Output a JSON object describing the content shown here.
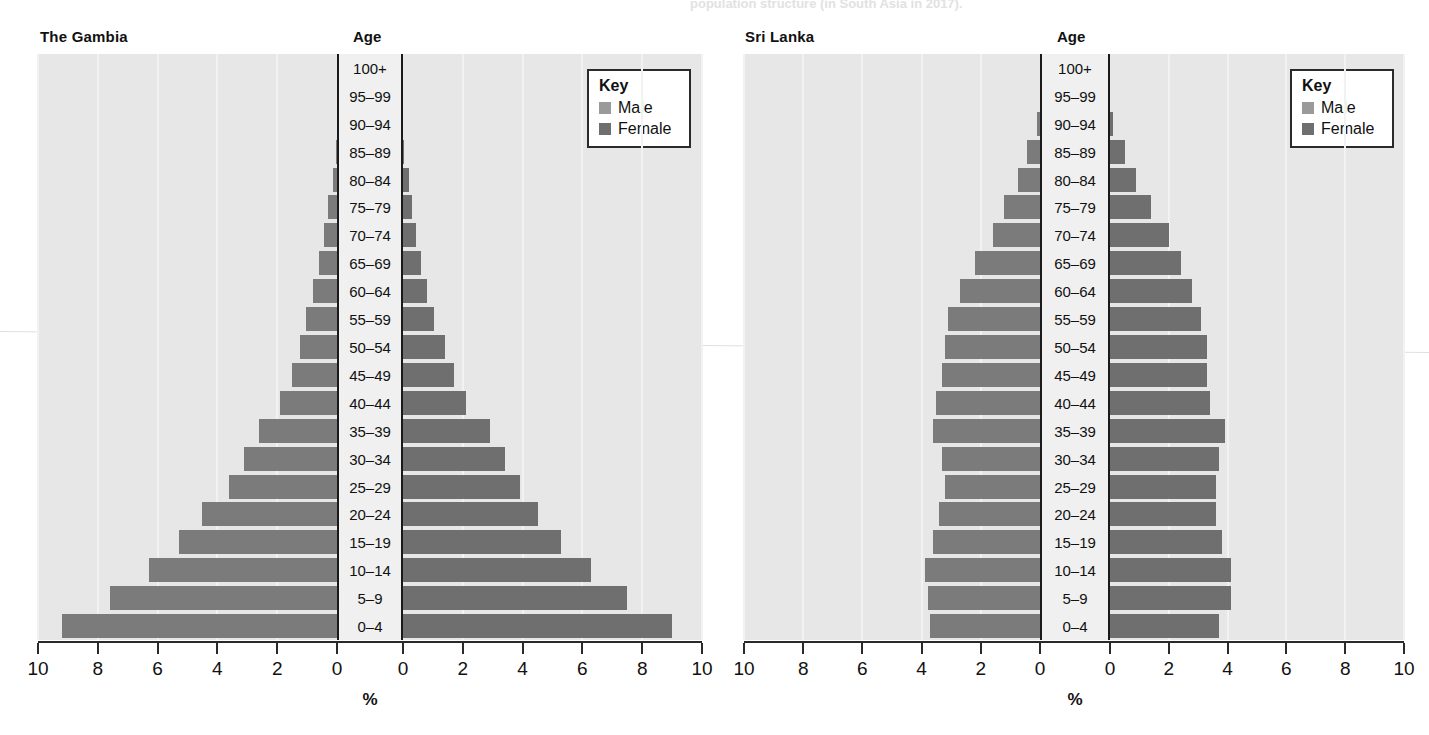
{
  "top_caption": "population structure (in South Asia in 2017).",
  "key": {
    "title": "Key",
    "male_label": "Male",
    "female_label": "Female",
    "male_color": "#9a9a9a",
    "female_color": "#6f6f6f"
  },
  "axis": {
    "title": "%",
    "age_header": "Age",
    "tick_labels_left": [
      "10",
      "8",
      "6",
      "4",
      "2",
      "0"
    ],
    "tick_labels_right": [
      "0",
      "2",
      "4",
      "6",
      "8",
      "10"
    ],
    "max": 10
  },
  "age_groups": [
    "100+",
    "95–99",
    "90–94",
    "85–89",
    "80–84",
    "75–79",
    "70–74",
    "65–69",
    "60–64",
    "55–59",
    "50–54",
    "45–49",
    "40–44",
    "35–39",
    "30–34",
    "25–29",
    "20–24",
    "15–19",
    "10–14",
    "5–9",
    "0–4"
  ],
  "chart_data": [
    {
      "type": "bar",
      "title": "The Gambia",
      "xlabel": "%",
      "ylabel": "Age",
      "xlim": [
        0,
        10
      ],
      "grid": true,
      "legend_position": "top-right",
      "categories": [
        "100+",
        "95–99",
        "90–94",
        "85–89",
        "80–84",
        "75–79",
        "70–74",
        "65–69",
        "60–64",
        "55–59",
        "50–54",
        "45–49",
        "40–44",
        "35–39",
        "30–34",
        "25–29",
        "20–24",
        "15–19",
        "10–14",
        "5–9",
        "0–4"
      ],
      "series": [
        {
          "name": "Male",
          "values": [
            0.0,
            0.0,
            0.0,
            0.05,
            0.15,
            0.3,
            0.45,
            0.6,
            0.8,
            1.05,
            1.25,
            1.5,
            1.9,
            2.6,
            3.1,
            3.6,
            4.5,
            5.3,
            6.3,
            7.6,
            9.2
          ]
        },
        {
          "name": "Female",
          "values": [
            0.0,
            0.0,
            0.0,
            0.05,
            0.2,
            0.3,
            0.45,
            0.6,
            0.8,
            1.05,
            1.4,
            1.7,
            2.1,
            2.9,
            3.4,
            3.9,
            4.5,
            5.3,
            6.3,
            7.5,
            9.0
          ]
        }
      ]
    },
    {
      "type": "bar",
      "title": "Sri Lanka",
      "xlabel": "%",
      "ylabel": "Age",
      "xlim": [
        0,
        10
      ],
      "grid": true,
      "legend_position": "top-right",
      "categories": [
        "100+",
        "95–99",
        "90–94",
        "85–89",
        "80–84",
        "75–79",
        "70–74",
        "65–69",
        "60–64",
        "55–59",
        "50–54",
        "45–49",
        "40–44",
        "35–39",
        "30–34",
        "25–29",
        "20–24",
        "15–19",
        "10–14",
        "5–9",
        "0–4"
      ],
      "series": [
        {
          "name": "Male",
          "values": [
            0.0,
            0.0,
            0.1,
            0.45,
            0.75,
            1.2,
            1.6,
            2.2,
            2.7,
            3.1,
            3.2,
            3.3,
            3.5,
            3.6,
            3.3,
            3.2,
            3.4,
            3.6,
            3.9,
            3.8,
            3.7
          ]
        },
        {
          "name": "Female",
          "values": [
            0.0,
            0.0,
            0.1,
            0.5,
            0.9,
            1.4,
            2.0,
            2.4,
            2.8,
            3.1,
            3.3,
            3.3,
            3.4,
            3.9,
            3.7,
            3.6,
            3.6,
            3.8,
            4.1,
            4.1,
            3.7
          ]
        }
      ]
    }
  ]
}
